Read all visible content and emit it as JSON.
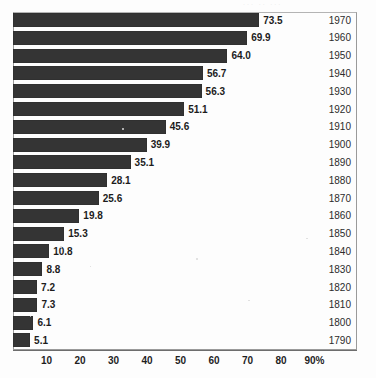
{
  "page": {
    "background_color": "#fdfdfd",
    "bar_color": "#343434",
    "frame_color": "#9a9a9a",
    "text_color": "#1c1c1c",
    "top_remnant_text": "··· ·· ···"
  },
  "chart_data": {
    "type": "bar",
    "orientation": "horizontal",
    "title": "",
    "subtitle": "",
    "xlabel": "",
    "ylabel": "",
    "xlim": [
      0,
      95
    ],
    "grid": false,
    "legend": null,
    "x_axis": {
      "tick_values": [
        10,
        20,
        30,
        40,
        50,
        60,
        70,
        80,
        90
      ],
      "tick_labels": [
        "10",
        "20",
        "30",
        "40",
        "50",
        "60",
        "70",
        "80",
        "90%"
      ],
      "unit": "%"
    },
    "categories": [
      "1970",
      "1960",
      "1950",
      "1940",
      "1930",
      "1920",
      "1910",
      "1900",
      "1890",
      "1880",
      "1870",
      "1860",
      "1850",
      "1840",
      "1830",
      "1820",
      "1810",
      "1800",
      "1790"
    ],
    "values": [
      73.5,
      69.9,
      64.0,
      56.7,
      56.3,
      51.1,
      45.6,
      39.9,
      35.1,
      28.1,
      25.6,
      19.8,
      15.3,
      10.8,
      8.8,
      7.2,
      7.3,
      6.1,
      5.1
    ],
    "value_labels": [
      "73.5",
      "69.9",
      "64.0",
      "56.7",
      "56.3",
      "51.1",
      "45.6",
      "39.9",
      "35.1",
      "28.1",
      "25.6",
      "19.8",
      "15.3",
      "10.8",
      "8.8",
      "7.2",
      "7.3",
      "6.1",
      "5.1"
    ],
    "bars": [
      {
        "category": "1970",
        "value": 73.5,
        "label": "73.5"
      },
      {
        "category": "1960",
        "value": 69.9,
        "label": "69.9"
      },
      {
        "category": "1950",
        "value": 64.0,
        "label": "64.0"
      },
      {
        "category": "1940",
        "value": 56.7,
        "label": "56.7"
      },
      {
        "category": "1930",
        "value": 56.3,
        "label": "56.3"
      },
      {
        "category": "1920",
        "value": 51.1,
        "label": "51.1"
      },
      {
        "category": "1910",
        "value": 45.6,
        "label": "45.6"
      },
      {
        "category": "1900",
        "value": 39.9,
        "label": "39.9"
      },
      {
        "category": "1890",
        "value": 35.1,
        "label": "35.1"
      },
      {
        "category": "1880",
        "value": 28.1,
        "label": "28.1"
      },
      {
        "category": "1870",
        "value": 25.6,
        "label": "25.6"
      },
      {
        "category": "1860",
        "value": 19.8,
        "label": "19.8"
      },
      {
        "category": "1850",
        "value": 15.3,
        "label": "15.3"
      },
      {
        "category": "1840",
        "value": 10.8,
        "label": "10.8"
      },
      {
        "category": "1830",
        "value": 8.8,
        "label": "8.8"
      },
      {
        "category": "1820",
        "value": 7.2,
        "label": "7.2"
      },
      {
        "category": "1810",
        "value": 7.3,
        "label": "7.3"
      },
      {
        "category": "1800",
        "value": 6.1,
        "label": "6.1"
      },
      {
        "category": "1790",
        "value": 5.1,
        "label": "5.1"
      }
    ]
  }
}
